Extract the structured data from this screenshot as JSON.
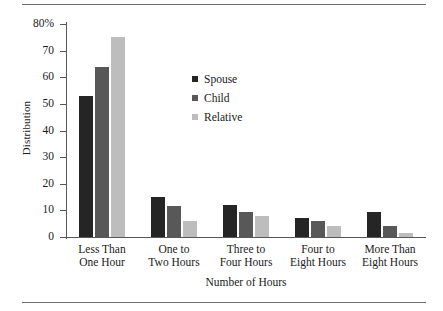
{
  "chart_data": {
    "type": "bar",
    "title": "",
    "xlabel": "Number of Hours",
    "ylabel": "Distribution",
    "categories": [
      "Less Than\nOne Hour",
      "One to\nTwo Hours",
      "Three to\nFour Hours",
      "Four to\nEight Hours",
      "More Than\nEight Hours"
    ],
    "category_lines": [
      [
        "Less Than",
        "One Hour"
      ],
      [
        "One to",
        "Two Hours"
      ],
      [
        "Three to",
        "Four Hours"
      ],
      [
        "Four to",
        "Eight Hours"
      ],
      [
        "More Than",
        "Eight Hours"
      ]
    ],
    "series": [
      {
        "name": "Spouse",
        "color": "#252525",
        "values": [
          53,
          15,
          12,
          7,
          9.5
        ]
      },
      {
        "name": "Child",
        "color": "#585858",
        "values": [
          64,
          11.5,
          9.5,
          6,
          4
        ]
      },
      {
        "name": "Relative",
        "color": "#bdbdbd",
        "values": [
          75,
          6,
          8,
          4,
          1.5
        ]
      }
    ],
    "ylim": [
      0,
      80
    ],
    "yticks": [
      0,
      10,
      20,
      30,
      40,
      50,
      60,
      70,
      80
    ],
    "ytick_labels": [
      "0",
      "10",
      "20",
      "30",
      "40",
      "50",
      "60",
      "70",
      "80%"
    ],
    "grid": false,
    "legend_position": "inside-upper-center"
  },
  "colors": {
    "axis": "#575757",
    "rule": "#6f6f6f",
    "text": "#1a1a1a",
    "background": "#ffffff"
  }
}
